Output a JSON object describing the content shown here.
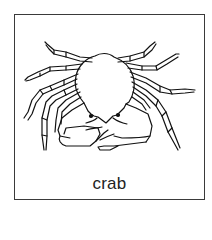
{
  "card": {
    "caption": "crab",
    "illustration": "crab-line-drawing",
    "border_color": "#3a3a3a",
    "stroke_color": "#111111"
  }
}
